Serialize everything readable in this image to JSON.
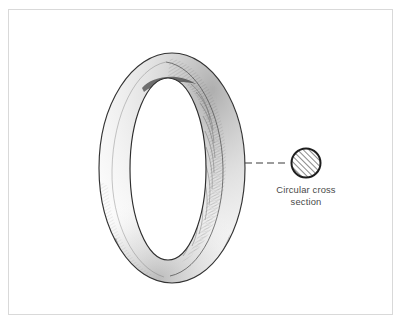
{
  "figure": {
    "background_color": "#ffffff",
    "frame_color": "#d9d9d9",
    "ink_color": "#3a3a3a",
    "shading_color": "#8a8a8a",
    "caption_color": "#4a4a4a"
  },
  "annotation": {
    "caption_line_1": "Circular cross",
    "caption_line_2": "section",
    "caption_full": "Circular cross\nsection"
  },
  "cross_section": {
    "shape": "circle",
    "center_x": 306,
    "center_y": 163,
    "radius": 15,
    "fill": "diagonal-hatch",
    "hatch_angle_degrees": 45,
    "stroke_color": "#1e1e1e",
    "stroke_width": 2
  },
  "leader_line": {
    "style": "dashed",
    "from_x": 245,
    "from_y": 163,
    "to_x": 289,
    "to_y": 163,
    "dash_pattern": "7 4",
    "color": "#3a3a3a"
  },
  "torus": {
    "outer_ellipse": {
      "cx": 172,
      "cy": 168,
      "rx": 73,
      "ry": 115,
      "rotation": -4
    },
    "inner_ellipse": {
      "cx": 168,
      "cy": 169,
      "rx": 38,
      "ry": 91,
      "rotation": -4
    },
    "hole_ellipse": {
      "cx": 168,
      "cy": 169,
      "rx": 38,
      "ry": 91,
      "rotation": -4
    },
    "style": "pencil hand-drawn line art with graphite shading",
    "shaded_regions": [
      "upper-right inner",
      "lower-left outer",
      "bottom"
    ]
  }
}
